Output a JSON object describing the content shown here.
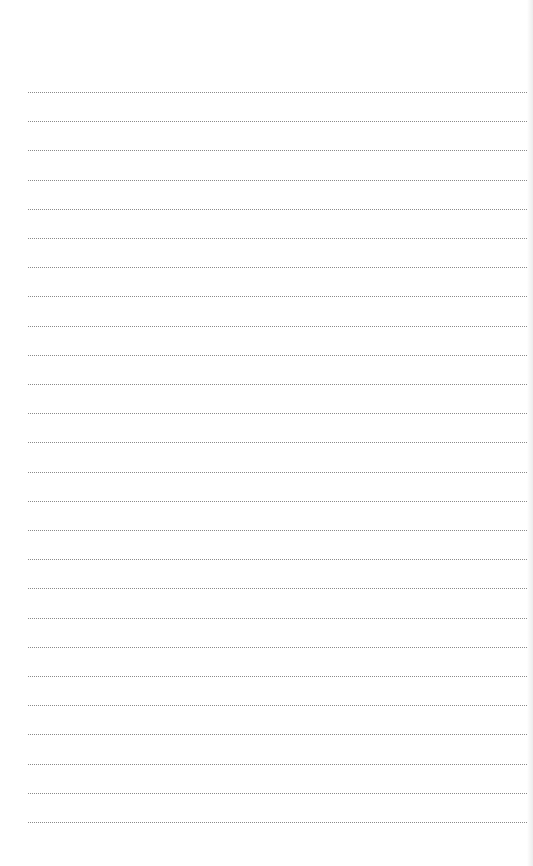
{
  "document": {
    "type": "dotted-lined-paper",
    "line_count": 26,
    "first_line_y": 92,
    "line_spacing": 29.2,
    "line_start_x": 28,
    "line_color": "#8a8a8a",
    "background_color": "#ffffff"
  }
}
